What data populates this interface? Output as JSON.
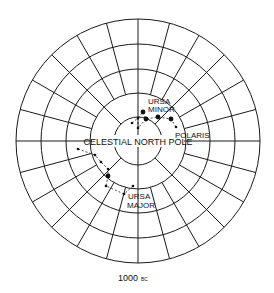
{
  "diagram": {
    "center": [
      138,
      141
    ],
    "ring_radii": [
      24,
      48,
      72,
      97,
      122
    ],
    "spoke_step_deg": 15,
    "line_color": "#1a1a1a",
    "labels": {
      "ursa_minor_line1": "URSA",
      "ursa_minor_line2": "MINOR",
      "polaris": "POLARIS",
      "celestial_north_pole": "CELESTIAL NORTH POLE",
      "ursa_major_line1": "URSA",
      "ursa_major_line2": "MAJOR",
      "epoch_year": "1000",
      "epoch_era": "BC"
    },
    "ursa_minor_stars": [
      {
        "x": 143,
        "y": 112,
        "size": "large"
      },
      {
        "x": 146,
        "y": 119,
        "size": "large"
      },
      {
        "x": 158,
        "y": 117,
        "size": "large"
      },
      {
        "x": 171,
        "y": 119,
        "size": "large"
      },
      {
        "x": 138,
        "y": 118,
        "size": "small"
      },
      {
        "x": 132,
        "y": 123,
        "size": "small"
      },
      {
        "x": 138,
        "y": 128,
        "size": "small"
      }
    ],
    "polaris_star": {
      "x": 176,
      "y": 127,
      "size": "small"
    },
    "ursa_major_stars": [
      {
        "x": 78,
        "y": 149,
        "size": "small"
      },
      {
        "x": 95,
        "y": 155,
        "size": "small"
      },
      {
        "x": 101,
        "y": 162,
        "size": "small"
      },
      {
        "x": 108,
        "y": 169,
        "size": "small"
      },
      {
        "x": 108,
        "y": 176,
        "size": "large"
      },
      {
        "x": 106,
        "y": 186,
        "size": "small"
      },
      {
        "x": 124,
        "y": 194,
        "size": "small"
      },
      {
        "x": 133,
        "y": 186,
        "size": "small"
      }
    ]
  }
}
